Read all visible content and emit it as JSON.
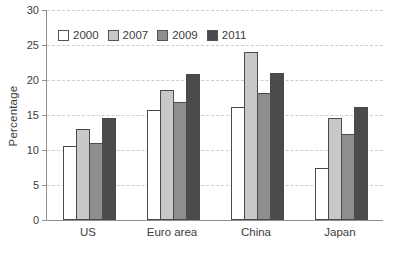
{
  "chart_data": {
    "type": "bar",
    "categories": [
      "US",
      "Euro area",
      "China",
      "Japan"
    ],
    "series": [
      {
        "name": "2000",
        "color": "#ffffff",
        "values": [
          10.5,
          15.7,
          16.2,
          7.4
        ]
      },
      {
        "name": "2007",
        "color": "#c8c8c8",
        "values": [
          13.0,
          18.5,
          24.0,
          14.5
        ]
      },
      {
        "name": "2009",
        "color": "#8e8e8e",
        "values": [
          11.0,
          16.9,
          18.2,
          12.3
        ]
      },
      {
        "name": "2011",
        "color": "#4b4b4b",
        "values": [
          14.5,
          20.8,
          21.0,
          16.1
        ]
      }
    ],
    "ylabel": "Percentage",
    "ylim": [
      0,
      30
    ],
    "yticks": [
      0,
      5,
      10,
      15,
      20,
      25,
      30
    ],
    "grid": "horizontal-dashed",
    "legend_position": "top-left-inside",
    "colors": {
      "axis": "#8f8f8f",
      "gridline": "#cdcdcd",
      "bar_border": "#4a4a4a",
      "text": "#3c3c3c"
    }
  }
}
